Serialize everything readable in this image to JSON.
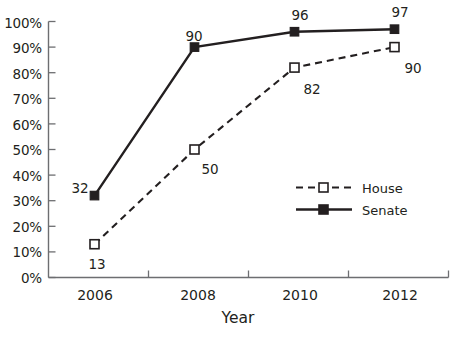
{
  "chart_data": {
    "type": "line",
    "title": "",
    "xlabel": "Year",
    "ylabel": "",
    "categories": [
      "2006",
      "2008",
      "2010",
      "2012"
    ],
    "x": [
      2006,
      2008,
      2010,
      2012
    ],
    "ylim": [
      0,
      100
    ],
    "ytick_labels": [
      "0%",
      "10%",
      "20%",
      "30%",
      "40%",
      "50%",
      "60%",
      "70%",
      "80%",
      "90%",
      "100%"
    ],
    "ytick_values": [
      0,
      10,
      20,
      30,
      40,
      50,
      60,
      70,
      80,
      90,
      100
    ],
    "grid": false,
    "legend_position": "inside-lower-right",
    "series": [
      {
        "name": "House",
        "values": [
          13,
          50,
          82,
          90
        ],
        "line_style": "dashed",
        "marker": "open-square",
        "color": "#231f20",
        "data_labels": [
          "13",
          "50",
          "82",
          "90"
        ]
      },
      {
        "name": "Senate",
        "values": [
          32,
          90,
          96,
          97
        ],
        "line_style": "solid",
        "marker": "filled-square",
        "color": "#231f20",
        "data_labels": [
          "32",
          "90",
          "96",
          "97"
        ]
      }
    ]
  },
  "axes": {
    "x_title": "Year",
    "x_tick_labels": [
      "2006",
      "2008",
      "2010",
      "2012"
    ],
    "y_tick_labels": [
      "100%",
      "90%",
      "80%",
      "70%",
      "60%",
      "50%",
      "40%",
      "30%",
      "20%",
      "10%",
      "0%"
    ]
  },
  "legend": {
    "items": [
      {
        "label": "House",
        "style": "dashed",
        "marker": "open-square"
      },
      {
        "label": "Senate",
        "style": "solid",
        "marker": "filled-square"
      }
    ]
  },
  "point_labels": {
    "senate": {
      "y2006": "32",
      "y2008": "90",
      "y2010": "96",
      "y2012": "97"
    },
    "house": {
      "y2006": "13",
      "y2008": "50",
      "y2010": "82",
      "y2012": "90"
    }
  },
  "colors": {
    "ink": "#231f20",
    "axis": "#6d6e71",
    "background": "#ffffff"
  }
}
